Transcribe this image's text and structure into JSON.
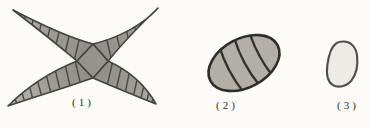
{
  "canvas": {
    "background": "#fcfbf8"
  },
  "figures": [
    {
      "label": "(1)",
      "description": "four-armed curved septate star-shaped spore"
    },
    {
      "label": "(2)",
      "description": "tilted ellipsoid spore with three transverse septa"
    },
    {
      "label": "(3)",
      "description": "small smooth oval aseptate spore"
    }
  ],
  "colors": {
    "outline": "#45433e",
    "septa": "#4a4841",
    "figure1_fill_center": "#8c8c86",
    "figure1_fill_tip": "#b9b9b1",
    "figure2_fill_light": "#b3afa7",
    "figure2_fill_dark": "#85827c",
    "figure2_outline": "#2f2d2a",
    "figure3_fill": "#edebe5",
    "figure3_outline": "#504d47",
    "label_text": "#33322f"
  }
}
